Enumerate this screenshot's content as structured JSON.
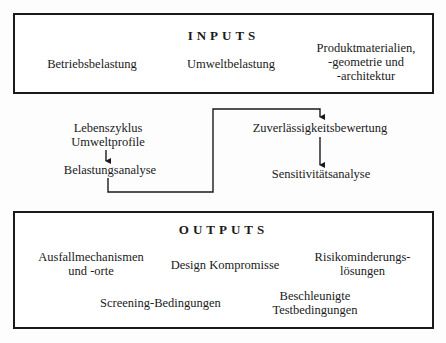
{
  "diagram": {
    "inputs": {
      "title": "INPUTS",
      "items": [
        {
          "line1": "Betriebsbelastung"
        },
        {
          "line1": "Umweltbelastung"
        },
        {
          "line1": "Produktmaterialien,",
          "line2": "-geometrie und",
          "line3": "-architektur"
        }
      ]
    },
    "process": {
      "left": {
        "lifecycle_line1": "Lebenszyklus",
        "lifecycle_line2": "Umweltprofile",
        "stress_analysis": "Belastungsanalyse"
      },
      "right": {
        "reliability": "Zuverlässigkeitsbewertung",
        "sensitivity": "Sensitivitätsanalyse"
      }
    },
    "outputs": {
      "title": "OUTPUTS",
      "items": [
        {
          "line1": "Ausfallmechanismen",
          "line2": "und -orte"
        },
        {
          "line1": "Design Kompromisse"
        },
        {
          "line1": "Risikominderungs-",
          "line2": "lösungen"
        },
        {
          "line1": "Screening-Bedingungen"
        },
        {
          "line1": "Beschleunigte",
          "line2": "Testbedingungen"
        }
      ]
    },
    "colors": {
      "line": "#1a1a1a",
      "background": "#fdfdfd"
    }
  }
}
